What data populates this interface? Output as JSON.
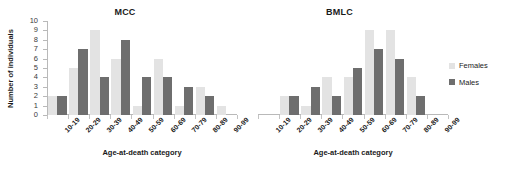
{
  "chart_data": [
    {
      "type": "bar",
      "title": "MCC",
      "xlabel": "Age-at-death category",
      "ylabel": "Number of individuals",
      "ylim": [
        0,
        10
      ],
      "yticks": [
        0,
        1,
        2,
        3,
        4,
        5,
        6,
        7,
        8,
        9,
        10
      ],
      "grid": false,
      "legend_position": "right",
      "categories": [
        "10-19",
        "20-29",
        "30-39",
        "40-49",
        "50-59",
        "60-69",
        "70-79",
        "80-89",
        "90-99"
      ],
      "series": [
        {
          "name": "Females",
          "color": "#e3e3e3",
          "values": [
            2,
            5,
            9,
            6,
            1,
            6,
            1,
            3,
            1
          ]
        },
        {
          "name": "Males",
          "color": "#6e6e6e",
          "values": [
            2,
            7,
            4,
            8,
            4,
            4,
            3,
            2,
            0
          ]
        }
      ]
    },
    {
      "type": "bar",
      "title": "BMLC",
      "xlabel": "Age-at-death category",
      "ylabel": "Number of individuals",
      "ylim": [
        0,
        10
      ],
      "yticks": [
        0,
        1,
        2,
        3,
        4,
        5,
        6,
        7,
        8,
        9,
        10
      ],
      "grid": false,
      "legend_position": "right",
      "categories": [
        "10-19",
        "20-29",
        "30-39",
        "40-49",
        "50-59",
        "60-69",
        "70-79",
        "80-89",
        "90-99"
      ],
      "series": [
        {
          "name": "Females",
          "color": "#e3e3e3",
          "values": [
            0,
            2,
            1,
            4,
            4,
            9,
            9,
            4,
            0
          ]
        },
        {
          "name": "Males",
          "color": "#6e6e6e",
          "values": [
            0,
            2,
            3,
            2,
            5,
            7,
            6,
            2,
            0
          ]
        }
      ]
    }
  ],
  "legend": {
    "items": [
      {
        "label": "Females",
        "color": "#e3e3e3"
      },
      {
        "label": "Males",
        "color": "#6e6e6e"
      }
    ]
  }
}
